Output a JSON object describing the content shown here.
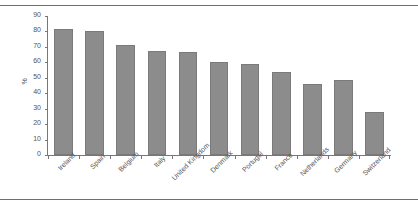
{
  "figure": {
    "title": "",
    "background_color": "#ffffff",
    "rule_color": "#6e6e6e"
  },
  "chart_data": {
    "type": "bar",
    "title": "",
    "subtitle": "",
    "xlabel": "",
    "ylabel": "%",
    "categories": [
      "Ireland",
      "Spain",
      "Belgium",
      "Italy",
      "United Kingdom",
      "Denmark",
      "Portugal",
      "France",
      "Netherlands",
      "Germany",
      "Switzerland"
    ],
    "values": [
      81.5,
      80,
      71.5,
      67.5,
      67,
      60.5,
      59,
      54,
      46,
      48.5,
      28
    ],
    "ylim": [
      0,
      90
    ],
    "ytick_values": [
      0,
      10,
      20,
      30,
      40,
      50,
      60,
      70,
      80,
      90
    ],
    "ytick_labels": [
      "0",
      "10",
      "20",
      "30",
      "40",
      "50",
      "60",
      "70",
      "80",
      "90"
    ],
    "grid": false,
    "legend": false,
    "legend_position": "none",
    "bar_color": "#8c8c8c",
    "bar_edge_color": "#7a7a7a",
    "xlabel_rotation": -45
  }
}
